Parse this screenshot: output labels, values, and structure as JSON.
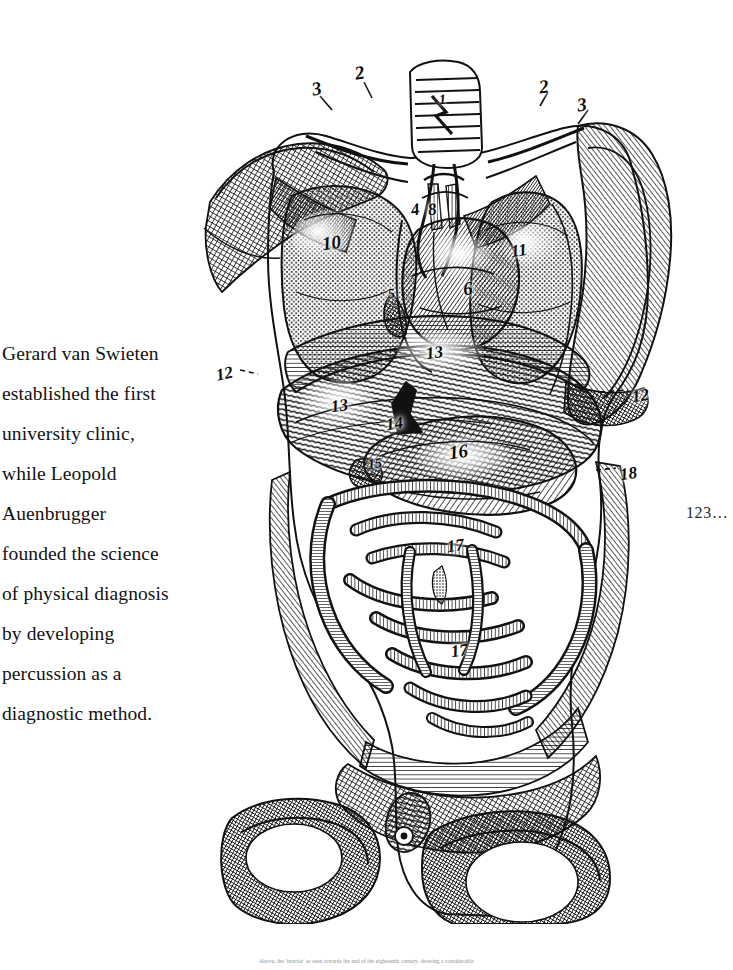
{
  "page": {
    "width": 733,
    "height": 970,
    "background": "#ffffff",
    "ink": "#111111"
  },
  "body_text": {
    "full": "Gerard van Swieten established the first university clinic, while Leopold Auenbrugger founded the science of physical diagnosis by developing percussion as a diagnostic method.",
    "lines": [
      "Gerard van Swieten",
      "established the first",
      "university clinic,",
      "while Leopold",
      "Auenbrugger",
      "founded the science",
      "of physical diagnosis",
      "by developing",
      "percussion as a",
      "diagnostic method."
    ]
  },
  "folio": {
    "text": "123…"
  },
  "caption": {
    "text": "Above, the 'interior' as seen towards the end of the eighteenth century, showing a considerable"
  },
  "figure": {
    "medium": "copperplate engraving, line and cross-hatching, black ink on white",
    "labels": [
      {
        "id": "l3a",
        "text": "3",
        "x": 116,
        "y": 26,
        "size": "lg",
        "rot": -12
      },
      {
        "id": "l2a",
        "text": "2",
        "x": 159,
        "y": 10,
        "size": "lg",
        "rot": -10
      },
      {
        "id": "l1",
        "text": "1",
        "x": 243,
        "y": 40,
        "size": "sm",
        "rot": -6
      },
      {
        "id": "l2b",
        "text": "2",
        "x": 343,
        "y": 24,
        "size": "lg",
        "rot": -8
      },
      {
        "id": "l3b",
        "text": "3",
        "x": 381,
        "y": 42,
        "size": "lg",
        "rot": -8
      },
      {
        "id": "l4",
        "text": "4",
        "x": 215,
        "y": 148,
        "size": "",
        "rot": -8
      },
      {
        "id": "l8",
        "text": "8",
        "x": 232,
        "y": 148,
        "size": "",
        "rot": -8
      },
      {
        "id": "l10",
        "text": "10",
        "x": 126,
        "y": 180,
        "size": "lg",
        "rot": -8
      },
      {
        "id": "l11",
        "text": "11",
        "x": 315,
        "y": 189,
        "size": "",
        "rot": -8
      },
      {
        "id": "l6",
        "text": "6",
        "x": 267,
        "y": 226,
        "size": "lg",
        "rot": -8
      },
      {
        "id": "l5",
        "text": "5",
        "x": 192,
        "y": 234,
        "size": "sm",
        "rot": -8
      },
      {
        "id": "l12a",
        "text": "12",
        "x": 20,
        "y": 312,
        "size": "",
        "rot": -12
      },
      {
        "id": "l13t",
        "text": "13",
        "x": 230,
        "y": 291,
        "size": "",
        "rot": -8
      },
      {
        "id": "l13l",
        "text": "13",
        "x": 135,
        "y": 344,
        "size": "",
        "rot": -8
      },
      {
        "id": "l14",
        "text": "14",
        "x": 190,
        "y": 362,
        "size": "",
        "rot": -8
      },
      {
        "id": "l16",
        "text": "16",
        "x": 253,
        "y": 389,
        "size": "lg",
        "rot": -8
      },
      {
        "id": "l15",
        "text": "15",
        "x": 172,
        "y": 404,
        "size": "sm",
        "rot": -8
      },
      {
        "id": "l12b",
        "text": "12",
        "x": 436,
        "y": 334,
        "size": "",
        "rot": -8
      },
      {
        "id": "l18",
        "text": "18",
        "x": 424,
        "y": 412,
        "size": "",
        "rot": -8
      },
      {
        "id": "l17a",
        "text": "17",
        "x": 251,
        "y": 484,
        "size": "",
        "rot": -8
      },
      {
        "id": "l17b",
        "text": "17",
        "x": 255,
        "y": 589,
        "size": "",
        "rot": -8
      }
    ]
  }
}
